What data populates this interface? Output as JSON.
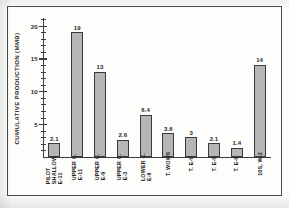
{
  "chart_data": {
    "type": "bar",
    "title": "",
    "xlabel": "",
    "ylabel": "CUMULATIVE PRODUCTION (MMB)",
    "ylim": [
      0,
      21.3
    ],
    "yticks": [
      5,
      10,
      15,
      20
    ],
    "ytick_labels": [
      "5",
      "10",
      "15",
      "20"
    ],
    "minor_tick_step": 1,
    "grid": false,
    "legend": null,
    "bar_color": "#b6b6b6",
    "bar_edge_color": "#3a3a3a",
    "categories": [
      "PILOT SHALLOW E-11",
      "UPPER C. E-11",
      "UPPER C. E-9",
      "UPPER C. E-3",
      "LOWER C. E-9",
      "T. WOW6",
      "T. E-9",
      "T. E-9",
      "T. E-9",
      "10S, W-2"
    ],
    "category_lines": [
      [
        "PILOT",
        "SHALLOW",
        "E-11"
      ],
      [
        "UPPER C.",
        "E-11"
      ],
      [
        "UPPER C.",
        "E-9"
      ],
      [
        "UPPER C.",
        "E-3"
      ],
      [
        "LOWER C.",
        "E-9"
      ],
      [
        "T. WOW6"
      ],
      [
        "T. E-9"
      ],
      [
        "T. E-9"
      ],
      [
        "T. E-9"
      ],
      [
        "10S, W-2"
      ]
    ],
    "values": [
      2.1,
      19,
      13,
      2.6,
      6.4,
      3.6,
      3,
      2.1,
      1.4,
      14
    ],
    "value_labels": [
      "2.1",
      "19",
      "13",
      "2.6",
      "6.4",
      "3.6",
      "3",
      "2.1",
      "1.4",
      "14"
    ]
  }
}
